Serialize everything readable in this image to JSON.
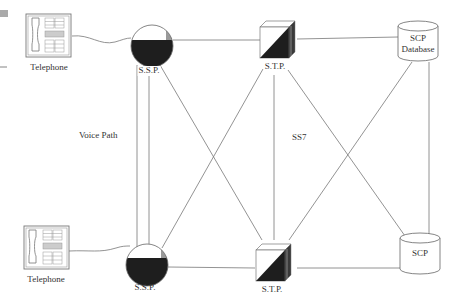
{
  "diagram": {
    "nodes": {
      "tel_top": {
        "label": "Telephone",
        "type": "telephone"
      },
      "tel_bottom": {
        "label": "Telephone",
        "type": "telephone"
      },
      "ssp_top": {
        "label": "S.S.P.",
        "type": "ssp"
      },
      "ssp_bottom": {
        "label": "S.S.P.",
        "type": "ssp"
      },
      "stp_top": {
        "label": "S.T.P.",
        "type": "stp"
      },
      "stp_bottom": {
        "label": "S.T.P.",
        "type": "stp"
      },
      "scp_db": {
        "label_line1": "SCP",
        "label_line2": "Database",
        "type": "database"
      },
      "scp": {
        "label": "SCP",
        "type": "database"
      }
    },
    "annotations": {
      "voice_path": "Voice Path",
      "ss7": "SS7"
    },
    "edges": [
      [
        "tel_top",
        "ssp_top"
      ],
      [
        "tel_bottom",
        "ssp_bottom"
      ],
      [
        "ssp_top",
        "ssp_bottom"
      ],
      [
        "ssp_top",
        "stp_top"
      ],
      [
        "ssp_top",
        "stp_bottom"
      ],
      [
        "ssp_bottom",
        "stp_top"
      ],
      [
        "ssp_bottom",
        "stp_bottom"
      ],
      [
        "stp_top",
        "stp_bottom"
      ],
      [
        "stp_top",
        "scp_db"
      ],
      [
        "stp_top",
        "scp"
      ],
      [
        "stp_bottom",
        "scp_db"
      ],
      [
        "stp_bottom",
        "scp"
      ],
      [
        "scp_db",
        "scp"
      ]
    ],
    "colors": {
      "line": "#777777",
      "fill_dark": "#1e1e1e",
      "fill_mid": "#9a9a9a",
      "outline": "#555555"
    }
  }
}
